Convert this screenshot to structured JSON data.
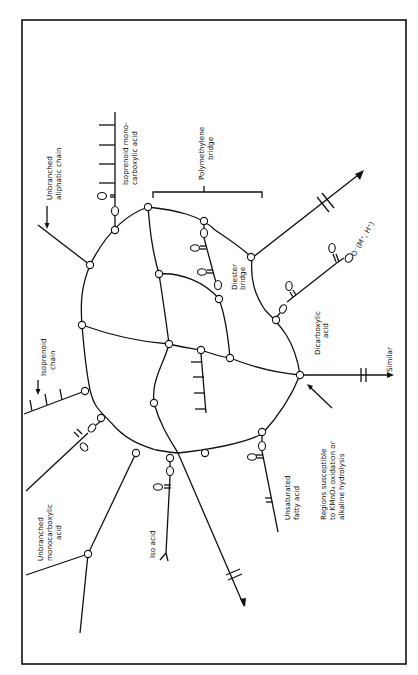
{
  "figure": {
    "type": "chemical-structure-diagram",
    "orientation": "rotated 90 degrees counter-clockwise"
  },
  "labels": {
    "unbranched_aliphatic": [
      "Unbranched",
      "aliphatic chain"
    ],
    "isoprenoid_mono": [
      "Isoprenoid  mono-",
      "carboxylic  acid"
    ],
    "polymethylene": [
      "Polymethylene",
      "bridge"
    ],
    "diester": [
      "Diester",
      "bridge"
    ],
    "carboxylate": "O⁻(M⁺, H⁺)",
    "dicarboxylic": [
      "Dicarboxylic",
      "acid"
    ],
    "similar": "Similar",
    "regions": [
      "Regions   susceptible",
      "to KMnO₄   oxidation  or",
      "alkaline  hydrolysis"
    ],
    "unsaturated": [
      "Unsaturated",
      "fatty  acid"
    ],
    "iso_acid": "Iso  acid",
    "unbranched_mono": [
      "Unbranched",
      "monocarboxylic",
      "acid"
    ],
    "isoprenoid_chain": [
      "Isoprenoid",
      "chain"
    ]
  },
  "glyphs": {
    "oxygen": "O",
    "ester_o": "O"
  }
}
